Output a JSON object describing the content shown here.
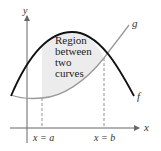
{
  "diagram": {
    "title": "Region between two curves",
    "axes": {
      "x_label": "x",
      "y_label": "y"
    },
    "curves": [
      {
        "name": "f",
        "label": "f",
        "color": "#111111",
        "shape": "downward parabola"
      },
      {
        "name": "g",
        "label": "g",
        "color": "#9a9a9a",
        "shape": "upward curve"
      }
    ],
    "region": {
      "label_lines": [
        "Region",
        "between",
        "two",
        "curves"
      ],
      "fill_color": "#ececec"
    },
    "bounds": {
      "left": "x = a",
      "right": "x = b"
    }
  }
}
